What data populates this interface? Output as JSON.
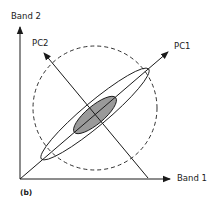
{
  "diagram": {
    "panel_label": "(b)",
    "axes": {
      "x_label": "Band 1",
      "y_label": "Band 2"
    },
    "principal_components": {
      "pc1_label": "PC1",
      "pc2_label": "PC2"
    },
    "shapes": {
      "dashed_circle": "uncorrelated distribution boundary",
      "outer_ellipse": "correlated data envelope",
      "inner_ellipse": "shaded high-density core"
    },
    "colors": {
      "line": "#1a1a1a",
      "ellipse_fill": "#9a9a9a",
      "background": "#ffffff"
    }
  }
}
